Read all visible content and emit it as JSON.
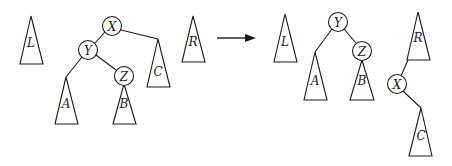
{
  "diagram": {
    "colors": {
      "stroke": "#1a1a1a",
      "background": "#ffffff"
    },
    "before": {
      "subtrees": {
        "L": "L",
        "R": "R",
        "A": "A",
        "B": "B",
        "C": "C"
      },
      "nodes": {
        "X": "X",
        "Y": "Y",
        "Z": "Z"
      },
      "edges": [
        [
          "X",
          "Y"
        ],
        [
          "X",
          "C"
        ],
        [
          "Y",
          "A"
        ],
        [
          "Y",
          "Z"
        ],
        [
          "Z",
          "B"
        ]
      ]
    },
    "arrow": {
      "direction": "right"
    },
    "after": {
      "subtrees": {
        "L": "L",
        "R": "R",
        "A": "A",
        "B": "B",
        "C": "C"
      },
      "nodes": {
        "X": "X",
        "Y": "Y",
        "Z": "Z"
      },
      "edges": [
        [
          "Y",
          "A"
        ],
        [
          "Y",
          "Z"
        ],
        [
          "Z",
          "B"
        ],
        [
          "R",
          "X"
        ],
        [
          "X",
          "C"
        ]
      ]
    }
  }
}
